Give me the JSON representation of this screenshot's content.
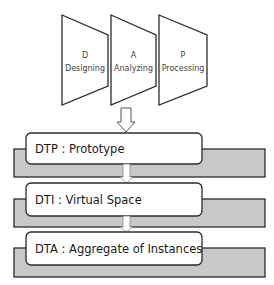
{
  "stages": [
    {
      "letter": "D",
      "name": "Designing"
    },
    {
      "letter": "A",
      "name": "Analyzing"
    },
    {
      "letter": "P",
      "name": "Processing"
    }
  ],
  "levels": [
    {
      "label": "DTP : Prototype"
    },
    {
      "label": "DTI : Virtual Space"
    },
    {
      "label": "DTA : Aggregate of Instances"
    }
  ],
  "colors": {
    "stroke": "#2b2b2b",
    "band_fill": "#c8c8c8",
    "box_fill": "#ffffff"
  }
}
